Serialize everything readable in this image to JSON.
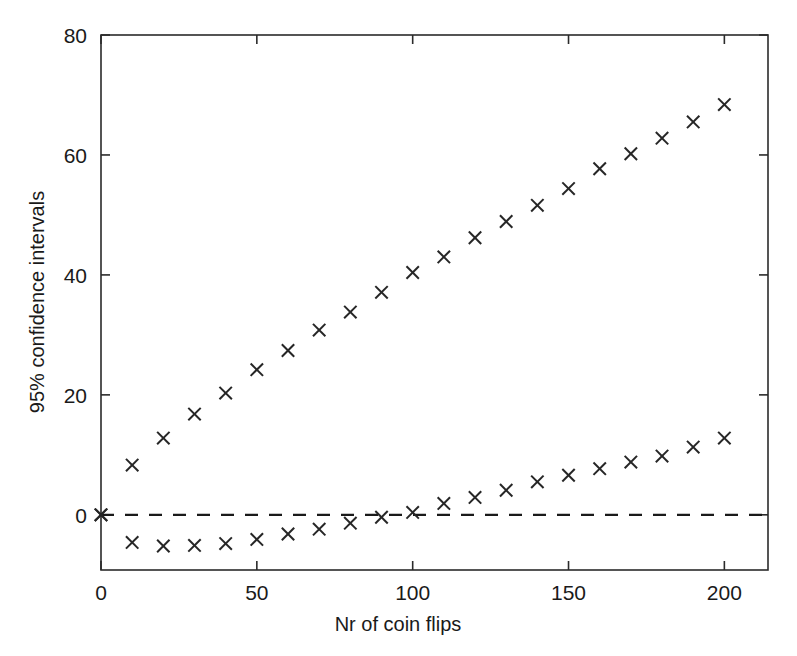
{
  "chart_data": {
    "type": "scatter",
    "title": "",
    "xlabel": "Nr of coin flips",
    "ylabel": "95% confidence intervals",
    "xlim": [
      0,
      214
    ],
    "ylim": [
      -9.2,
      80
    ],
    "xticks": [
      0,
      50,
      100,
      150,
      200
    ],
    "yticks": [
      0,
      20,
      40,
      60,
      80
    ],
    "xticklabels": [
      "0",
      "50",
      "100",
      "150",
      "200"
    ],
    "yticklabels": [
      "0",
      "20",
      "40",
      "60",
      "80"
    ],
    "grid": false,
    "legend": null,
    "marker": "x",
    "marker_color": "#262626",
    "frame_color": "#2b2b2b",
    "reference_line": {
      "orientation": "horizontal",
      "value": 0,
      "style": "dashed",
      "color": "#1a1a1a"
    },
    "series": [
      {
        "name": "upper confidence limit",
        "x": [
          0,
          10,
          20,
          30,
          40,
          50,
          60,
          70,
          80,
          90,
          100,
          110,
          120,
          130,
          140,
          150,
          160,
          170,
          180,
          190,
          200
        ],
        "values": [
          0,
          8.3,
          12.8,
          16.8,
          20.3,
          24.2,
          27.4,
          30.8,
          33.8,
          37.1,
          40.4,
          43.0,
          46.2,
          48.9,
          51.6,
          54.4,
          57.7,
          60.2,
          62.8,
          65.5,
          68.4
        ]
      },
      {
        "name": "lower confidence limit",
        "x": [
          0,
          10,
          20,
          30,
          40,
          50,
          60,
          70,
          80,
          90,
          100,
          110,
          120,
          130,
          140,
          150,
          160,
          170,
          180,
          190,
          200
        ],
        "values": [
          0,
          -4.6,
          -5.2,
          -5.1,
          -4.8,
          -4.1,
          -3.2,
          -2.4,
          -1.4,
          -0.4,
          0.4,
          1.9,
          2.9,
          4.1,
          5.5,
          6.6,
          7.7,
          8.8,
          9.8,
          11.3,
          12.8
        ]
      }
    ]
  },
  "axis_geometry": {
    "plot_left": 101,
    "plot_right": 768,
    "plot_top": 35,
    "plot_bottom": 570
  }
}
